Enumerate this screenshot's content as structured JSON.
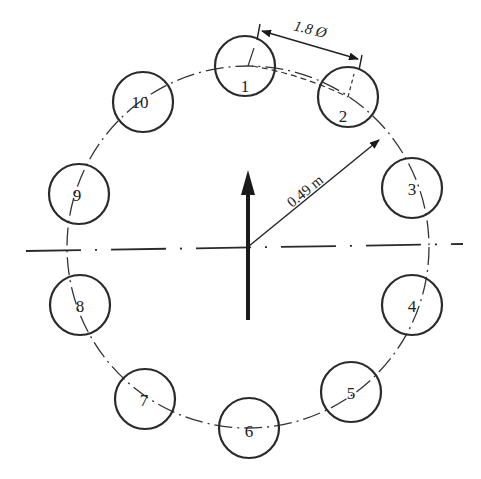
{
  "diagram": {
    "type": "circular-array-layout",
    "center": {
      "x": 248,
      "y": 247
    },
    "pitch_radius_px": 200,
    "element_radius_px": 30,
    "elements": [
      {
        "label": "1",
        "x": 245,
        "y": 66
      },
      {
        "label": "2",
        "x": 348,
        "y": 97
      },
      {
        "label": "3",
        "x": 412,
        "y": 188
      },
      {
        "label": "4",
        "x": 412,
        "y": 305
      },
      {
        "label": "5",
        "x": 351,
        "y": 392
      },
      {
        "label": "6",
        "x": 249,
        "y": 428
      },
      {
        "label": "7",
        "x": 145,
        "y": 399
      },
      {
        "label": "8",
        "x": 80,
        "y": 305
      },
      {
        "label": "9",
        "x": 79,
        "y": 194
      },
      {
        "label": "10",
        "x": 143,
        "y": 102
      }
    ],
    "dimensions": {
      "spacing_label": "1.8 Ø",
      "radius_label": "0.49 m"
    },
    "annotations": {
      "direction_arrow": "up"
    }
  }
}
